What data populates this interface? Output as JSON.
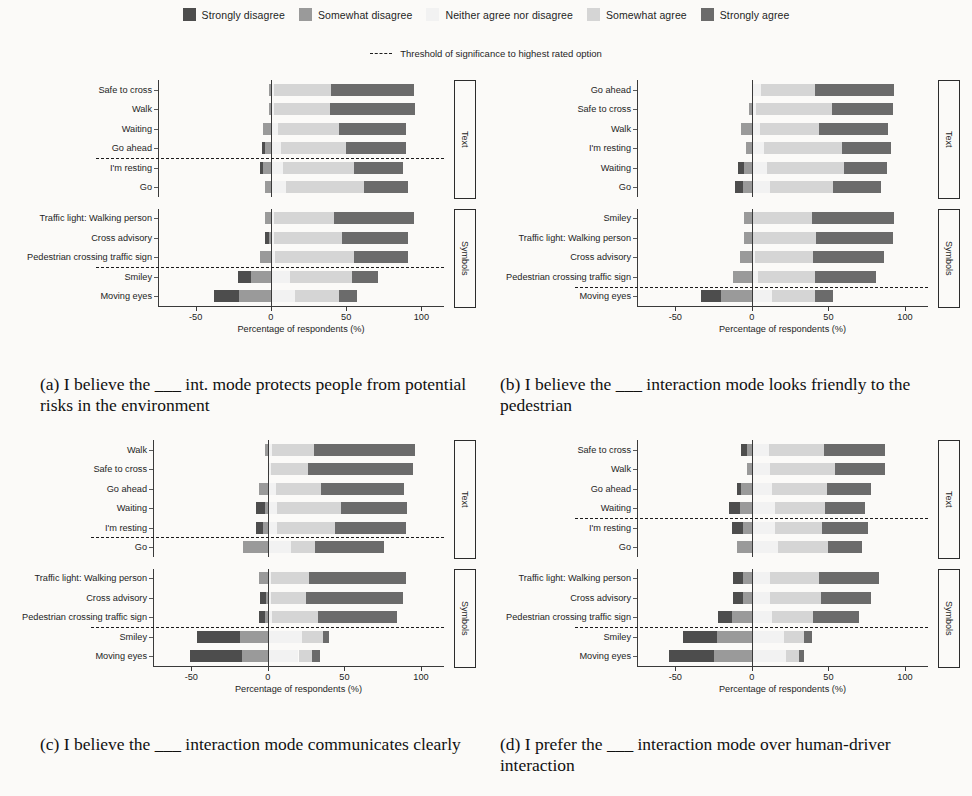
{
  "legend": {
    "items": [
      {
        "label": "Strongly disagree",
        "color": "#4d4d4d",
        "icon": "legend-swatch"
      },
      {
        "label": "Somewhat disagree",
        "color": "#9a9a9a",
        "icon": "legend-swatch"
      },
      {
        "label": "Neither agree nor disagree",
        "color": "#f2f2f2",
        "icon": "legend-swatch"
      },
      {
        "label": "Somewhat agree",
        "color": "#d5d5d5",
        "icon": "legend-swatch"
      },
      {
        "label": "Strongly agree",
        "color": "#6b6b6b",
        "icon": "legend-swatch"
      }
    ]
  },
  "threshold_note": "Threshold of significance to highest rated option",
  "axis": {
    "xlabel": "Percentage of respondents (%)",
    "ticks": [
      "-50",
      "0",
      "50",
      "100"
    ],
    "tick_values": [
      -50,
      0,
      50,
      100
    ]
  },
  "group_labels": {
    "text": "Text",
    "symbols": "Symbols"
  },
  "captions": {
    "a": "(a) I believe the ___ int. mode protects people from potential risks in the environment",
    "b": "(b) I believe the ___ interaction mode looks friendly to the pedestrian",
    "c": "(c) I believe the ___ interaction mode communicates clearly",
    "d": "(d) I prefer the ___ interaction mode over human-driver interaction"
  },
  "chart_data": [
    {
      "id": "a",
      "type": "bar",
      "subtype": "diverging-stacked-likert",
      "title": "(a) I believe the ___ int. mode protects people from potential risks in the environment",
      "xlabel": "Percentage of respondents (%)",
      "ylabel": "",
      "xlim": [
        -75,
        115
      ],
      "grid": false,
      "legend_position": "figure-top",
      "legend": [
        "Strongly disagree",
        "Somewhat disagree",
        "Neither agree nor disagree",
        "Somewhat agree",
        "Strongly agree"
      ],
      "groups": [
        {
          "name": "Text",
          "threshold_after": 4,
          "categories": [
            "Safe to cross",
            "Walk",
            "Waiting",
            "Go ahead",
            "I'm resting",
            "Go"
          ],
          "series": [
            {
              "name": "Strongly disagree",
              "values": [
                0,
                0,
                0,
                -2,
                -2,
                0
              ]
            },
            {
              "name": "Somewhat disagree",
              "values": [
                -1,
                -1,
                -5,
                -4,
                -5,
                -4
              ]
            },
            {
              "name": "Neither agree nor disagree",
              "values": [
                2,
                2,
                5,
                7,
                8,
                10
              ]
            },
            {
              "name": "Somewhat agree",
              "values": [
                38,
                37,
                40,
                43,
                47,
                52
              ]
            },
            {
              "name": "Strongly agree",
              "values": [
                55,
                57,
                45,
                40,
                33,
                29
              ]
            }
          ]
        },
        {
          "name": "Symbols",
          "threshold_after": 3,
          "categories": [
            "Traffic light: Walking person",
            "Cross advisory",
            "Pedestrian crossing traffic sign",
            "Smiley",
            "Moving eyes"
          ],
          "series": [
            {
              "name": "Strongly disagree",
              "values": [
                0,
                -3,
                0,
                -9,
                -17
              ]
            },
            {
              "name": "Somewhat disagree",
              "values": [
                -4,
                -1,
                -7,
                -13,
                -21
              ]
            },
            {
              "name": "Neither agree nor disagree",
              "values": [
                2,
                2,
                3,
                13,
                16
              ]
            },
            {
              "name": "Somewhat agree",
              "values": [
                40,
                45,
                52,
                41,
                29
              ]
            },
            {
              "name": "Strongly agree",
              "values": [
                53,
                44,
                36,
                17,
                12
              ]
            }
          ]
        }
      ]
    },
    {
      "id": "b",
      "type": "bar",
      "subtype": "diverging-stacked-likert",
      "title": "(b) I believe the ___ interaction mode looks friendly to the pedestrian",
      "xlabel": "Percentage of respondents (%)",
      "ylabel": "",
      "xlim": [
        -75,
        115
      ],
      "grid": false,
      "legend_position": "figure-top",
      "legend": [
        "Strongly disagree",
        "Somewhat disagree",
        "Neither agree nor disagree",
        "Somewhat agree",
        "Strongly agree"
      ],
      "groups": [
        {
          "name": "Text",
          "threshold_after": 6,
          "categories": [
            "Go ahead",
            "Safe to cross",
            "Walk",
            "I'm resting",
            "Waiting",
            "Go"
          ],
          "series": [
            {
              "name": "Strongly disagree",
              "values": [
                0,
                0,
                0,
                0,
                -4,
                -5
              ]
            },
            {
              "name": "Somewhat disagree",
              "values": [
                0,
                -2,
                -7,
                -4,
                -5,
                -6
              ]
            },
            {
              "name": "Neither agree nor disagree",
              "values": [
                6,
                3,
                5,
                8,
                10,
                12
              ]
            },
            {
              "name": "Somewhat agree",
              "values": [
                35,
                49,
                39,
                51,
                50,
                41
              ]
            },
            {
              "name": "Strongly agree",
              "values": [
                52,
                40,
                45,
                32,
                28,
                31
              ]
            }
          ]
        },
        {
          "name": "Symbols",
          "threshold_after": 4,
          "categories": [
            "Smiley",
            "Traffic light: Walking person",
            "Cross advisory",
            "Pedestrian crossing traffic sign",
            "Moving eyes"
          ],
          "series": [
            {
              "name": "Strongly disagree",
              "values": [
                0,
                0,
                0,
                0,
                -13
              ]
            },
            {
              "name": "Somewhat disagree",
              "values": [
                -5,
                -5,
                -8,
                -12,
                -20
              ]
            },
            {
              "name": "Neither agree nor disagree",
              "values": [
                1,
                1,
                2,
                4,
                13
              ]
            },
            {
              "name": "Somewhat agree",
              "values": [
                38,
                41,
                38,
                37,
                28
              ]
            },
            {
              "name": "Strongly agree",
              "values": [
                54,
                50,
                46,
                40,
                12
              ]
            }
          ]
        }
      ]
    },
    {
      "id": "c",
      "type": "bar",
      "subtype": "diverging-stacked-likert",
      "title": "(c) I believe the ___ interaction mode communicates clearly",
      "xlabel": "Percentage of respondents (%)",
      "ylabel": "",
      "xlim": [
        -75,
        115
      ],
      "grid": false,
      "legend_position": "figure-top",
      "legend": [
        "Strongly disagree",
        "Somewhat disagree",
        "Neither agree nor disagree",
        "Somewhat agree",
        "Strongly agree"
      ],
      "groups": [
        {
          "name": "Text",
          "threshold_after": 5,
          "categories": [
            "Walk",
            "Safe to cross",
            "Go ahead",
            "Waiting",
            "I'm resting",
            "Go"
          ],
          "series": [
            {
              "name": "Strongly disagree",
              "values": [
                0,
                0,
                0,
                -6,
                -5,
                0
              ]
            },
            {
              "name": "Somewhat disagree",
              "values": [
                -2,
                0,
                -6,
                -2,
                -3,
                -16
              ]
            },
            {
              "name": "Neither agree nor disagree",
              "values": [
                3,
                2,
                5,
                6,
                6,
                15
              ]
            },
            {
              "name": "Somewhat agree",
              "values": [
                27,
                24,
                30,
                42,
                38,
                16
              ]
            },
            {
              "name": "Strongly agree",
              "values": [
                66,
                69,
                54,
                43,
                46,
                45
              ]
            }
          ]
        },
        {
          "name": "Symbols",
          "threshold_after": 3,
          "categories": [
            "Traffic light: Walking person",
            "Cross advisory",
            "Pedestrian crossing traffic sign",
            "Smiley",
            "Moving eyes"
          ],
          "series": [
            {
              "name": "Strongly disagree",
              "values": [
                0,
                -4,
                -4,
                -28,
                -34
              ]
            },
            {
              "name": "Somewhat disagree",
              "values": [
                -6,
                -1,
                -2,
                -18,
                -17
              ]
            },
            {
              "name": "Neither agree nor disagree",
              "values": [
                2,
                2,
                3,
                22,
                20
              ]
            },
            {
              "name": "Somewhat agree",
              "values": [
                25,
                23,
                30,
                14,
                9
              ]
            },
            {
              "name": "Strongly agree",
              "values": [
                63,
                63,
                51,
                4,
                5
              ]
            }
          ]
        }
      ]
    },
    {
      "id": "d",
      "type": "bar",
      "subtype": "diverging-stacked-likert",
      "title": "(d) I prefer the ___ interaction mode over human-driver interaction",
      "xlabel": "Percentage of respondents (%)",
      "ylabel": "",
      "xlim": [
        -75,
        115
      ],
      "grid": false,
      "legend_position": "figure-top",
      "legend": [
        "Strongly disagree",
        "Somewhat disagree",
        "Neither agree nor disagree",
        "Somewhat agree",
        "Strongly agree"
      ],
      "groups": [
        {
          "name": "Text",
          "threshold_after": 4,
          "categories": [
            "Safe to cross",
            "Walk",
            "Go ahead",
            "Waiting",
            "I'm resting",
            "Go"
          ],
          "series": [
            {
              "name": "Strongly disagree",
              "values": [
                -4,
                0,
                -3,
                -7,
                -7,
                0
              ]
            },
            {
              "name": "Somewhat disagree",
              "values": [
                -3,
                -3,
                -7,
                -8,
                -6,
                -10
              ]
            },
            {
              "name": "Neither agree nor disagree",
              "values": [
                11,
                12,
                13,
                15,
                15,
                17
              ]
            },
            {
              "name": "Somewhat agree",
              "values": [
                36,
                42,
                36,
                33,
                31,
                33
              ]
            },
            {
              "name": "Strongly agree",
              "values": [
                40,
                33,
                29,
                26,
                30,
                22
              ]
            }
          ]
        },
        {
          "name": "Symbols",
          "threshold_after": 3,
          "categories": [
            "Traffic light: Walking person",
            "Cross advisory",
            "Pedestrian crossing traffic sign",
            "Smiley",
            "Moving eyes"
          ],
          "series": [
            {
              "name": "Strongly disagree",
              "values": [
                -6,
                -6,
                -9,
                -22,
                -29
              ]
            },
            {
              "name": "Somewhat disagree",
              "values": [
                -6,
                -6,
                -13,
                -23,
                -25
              ]
            },
            {
              "name": "Neither agree nor disagree",
              "values": [
                12,
                12,
                13,
                21,
                22
              ]
            },
            {
              "name": "Somewhat agree",
              "values": [
                32,
                33,
                27,
                13,
                9
              ]
            },
            {
              "name": "Strongly agree",
              "values": [
                39,
                33,
                30,
                5,
                3
              ]
            }
          ]
        }
      ]
    }
  ]
}
